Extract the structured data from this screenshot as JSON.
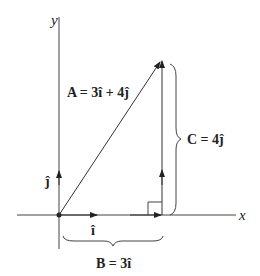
{
  "diagram": {
    "axes": {
      "x_label": "x",
      "y_label": "y"
    },
    "unit_vectors": {
      "i_label": "î",
      "j_label": "ĵ"
    },
    "vectors": {
      "A": {
        "label": "A = 3î + 4ĵ",
        "components": [
          3,
          4
        ]
      },
      "B": {
        "label": "B = 3î",
        "components": [
          3,
          0
        ]
      },
      "C": {
        "label": "C = 4ĵ",
        "components": [
          0,
          4
        ]
      }
    },
    "colors": {
      "line": "#333333",
      "text": "#222222",
      "background": "#ffffff"
    }
  }
}
